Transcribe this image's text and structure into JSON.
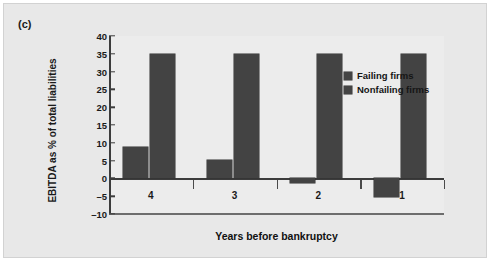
{
  "figure": {
    "panel_letter": "(c)",
    "background_color": "#e8e8e8",
    "plot_background_color": "#ececec",
    "bar_color": "#434343",
    "axis_color": "#3c3c3c"
  },
  "chart_data": {
    "type": "bar",
    "title": "",
    "subtitle": "",
    "xlabel": "Years before bankruptcy",
    "ylabel": "EBITDA as % of total liabilities",
    "categories": [
      "4",
      "3",
      "2",
      "1"
    ],
    "series": [
      {
        "name": "Failing firms",
        "values": [
          8.7,
          5.1,
          -1.2,
          -5.3
        ],
        "color": "#434343"
      },
      {
        "name": "Nonfailing firms",
        "values": [
          35,
          35,
          35,
          35
        ],
        "color": "#434343"
      }
    ],
    "ylim": [
      -10,
      40
    ],
    "ytick_step": 5,
    "yticks": [
      40,
      35,
      30,
      25,
      20,
      15,
      10,
      5,
      0,
      -5,
      -10
    ],
    "ytick_labels": [
      "40",
      "35",
      "30",
      "25",
      "20",
      "15",
      "10",
      "5",
      "0",
      "–5",
      "–10"
    ],
    "grid": false,
    "legend_position": "right",
    "legend": [
      "Failing firms",
      "Nonfailing firms"
    ]
  }
}
